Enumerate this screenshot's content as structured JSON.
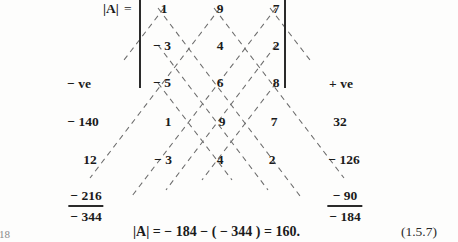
{
  "document": {
    "kind": "textbook-figure",
    "description": "Sarrus rule diagonal expansion of a 3x3 determinant",
    "page_marker": "18",
    "equation_number": "(1.5.7)"
  },
  "heading": {
    "determinant_symbol": "|A|",
    "equals": "="
  },
  "matrix": {
    "rows": [
      [
        "1",
        "9",
        "7"
      ],
      [
        "− 3",
        "4",
        "2"
      ],
      [
        "− 5",
        "6",
        "8"
      ]
    ]
  },
  "repeated_rows": {
    "rows": [
      [
        "1",
        "9",
        "7"
      ],
      [
        "− 3",
        "4",
        "2"
      ]
    ]
  },
  "sign_labels": {
    "negative": "− ve",
    "positive": "+ ve"
  },
  "products": {
    "left": [
      "− 140",
      "12",
      "− 216"
    ],
    "right": [
      "32",
      "− 126",
      "− 90"
    ]
  },
  "sums": {
    "left_total": "− 344",
    "right_total": "− 184"
  },
  "result_equation": {
    "symbol": "|A|",
    "expression": "= − 184 − ( − 344 ) = 160."
  },
  "style": {
    "ink": "#1b1b1b",
    "dash_color": "#6d6d6d",
    "paper": "#fdfdfc"
  }
}
